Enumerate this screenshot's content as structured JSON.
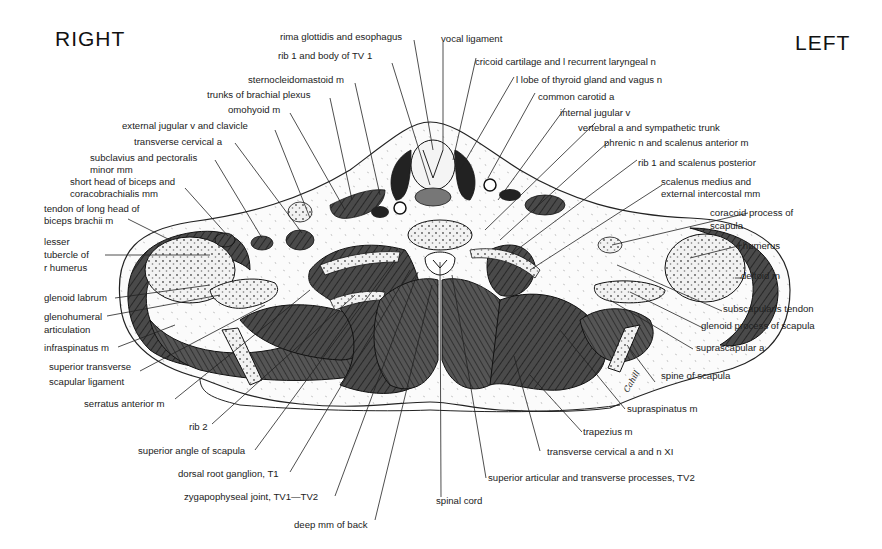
{
  "orientation": {
    "right": "RIGHT",
    "left": "LEFT"
  },
  "signature": "Cahill",
  "labels": {
    "rima_glottidis": "rima glottidis and esophagus",
    "rib1_tv1": "rib 1 and body of TV 1",
    "sternocleidomastoid": "sternocleidomastoid m",
    "trunks_brachial_plexus": "trunks of brachial plexus",
    "omohyoid": "omohyoid m",
    "external_jugular": "external jugular v and clavicle",
    "transverse_cervical_a": "transverse cervical a",
    "subclavius_1": "subclavius and pectoralis",
    "subclavius_2": "minor mm",
    "short_head_1": "short head of biceps and",
    "short_head_2": "coracobrachialis mm",
    "tendon_long_head_1": "tendon of long head of",
    "tendon_long_head_2": "biceps brachii m",
    "lesser_tubercle_1": "lesser",
    "lesser_tubercle_2": "tubercle of",
    "lesser_tubercle_3": "r humerus",
    "glenoid_labrum": "glenoid labrum",
    "glenohumeral_1": "glenohumeral",
    "glenohumeral_2": "articulation",
    "infraspinatus": "infraspinatus m",
    "sup_transverse_1": "superior transverse",
    "sup_transverse_2": "scapular ligament",
    "serratus_anterior": "serratus anterior m",
    "rib2": "rib 2",
    "superior_angle": "superior angle of scapula",
    "dorsal_root": "dorsal root ganglion, T1",
    "zygapophyseal": "zygapophyseal joint, TV1—TV2",
    "deep_mm": "deep mm of back",
    "spinal_cord": "spinal cord",
    "superior_articular": "superior articular and transverse processes, TV2",
    "transverse_cervical_xi": "transverse cervical a and n XI",
    "trapezius": "trapezius m",
    "supraspinatus": "supraspinatus m",
    "spine_scapula": "spine of scapula",
    "suprascapular_a": "suprascapular a",
    "glenoid_process": "glenoid process of scapula",
    "subscapularis_tendon": "subscapularis tendon",
    "deltoid": "deltoid m",
    "l_humerus": "l humerus",
    "coracoid_1": "coracoid process of",
    "coracoid_2": "scapula",
    "scalenus_medius_1": "scalenus medius and",
    "scalenus_medius_2": "external intercostal mm",
    "rib1_scalenus_posterior": "rib 1 and scalenus posterior",
    "phrenic": "phrenic n and scalenus anterior m",
    "vertebral_a": "vertebral a and sympathetic trunk",
    "internal_jugular": "internal jugular v",
    "common_carotid": "common carotid a",
    "l_lobe_thyroid": "l lobe of thyroid gland and vagus n",
    "cricoid": "cricoid cartilage and l recurrent laryngeal n",
    "vocal_ligament": "vocal ligament"
  },
  "colors": {
    "ink": "#1a1a1a",
    "muscle_dark": "#3a3a3a",
    "muscle_mid": "#5a5a5a",
    "bone_fill": "#eeeeee",
    "background": "#ffffff"
  }
}
